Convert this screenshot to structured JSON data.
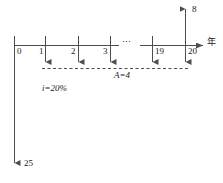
{
  "diagram": {
    "type": "cash-flow-timeline",
    "axis": {
      "name": "time-axis",
      "label": "年",
      "tick_labels": [
        "0",
        "1",
        "2",
        "3",
        "19",
        "20"
      ],
      "ellipsis": "⋯"
    },
    "inflow": {
      "name": "present-value-arrow",
      "label": "25",
      "direction": "down",
      "at_tick": "0"
    },
    "salvage": {
      "name": "salvage-value-arrow",
      "label": "8",
      "direction": "up",
      "at_tick": "20"
    },
    "annuity": {
      "name": "annuity-series",
      "label": "A=4",
      "direction": "down",
      "at_ticks": [
        "1",
        "2",
        "3",
        "19",
        "20"
      ]
    },
    "interest": {
      "name": "interest-rate-label",
      "label": "i=20%"
    },
    "colors": {
      "stroke": "#4d4d4d",
      "text": "#1a1a1a",
      "background": "#ffffff"
    }
  }
}
